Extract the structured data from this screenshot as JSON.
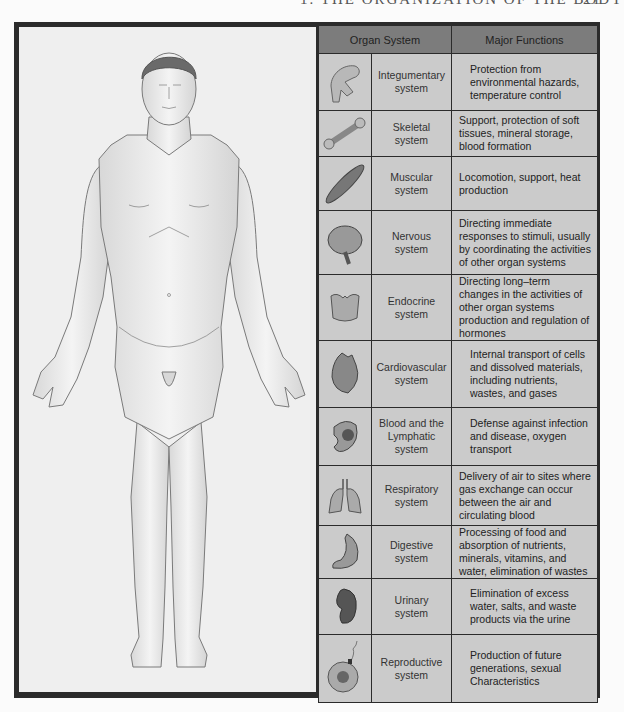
{
  "running_head": {
    "title": "1. THE ORGANIZATION OF THE BODY",
    "page": "21"
  },
  "figure": {
    "label": "Anterior view of human male body"
  },
  "table": {
    "headers": {
      "organ_system": "Organ System",
      "major_functions": "Major Functions"
    },
    "rows": [
      {
        "icon": "hand-skin-icon",
        "name1": "Integumentary",
        "name2": "system",
        "functions": "Protection from environmental hazards, temperature control"
      },
      {
        "icon": "bone-icon",
        "name1": "Skeletal",
        "name2": "system",
        "functions": "Support, protection of soft tissues, mineral storage, blood formation"
      },
      {
        "icon": "muscle-icon",
        "name1": "Muscular",
        "name2": "system",
        "functions": "Locomotion, support, heat production"
      },
      {
        "icon": "brain-icon",
        "name1": "Nervous",
        "name2": "system",
        "functions": "Directing immediate responses to stimuli, usually by coordinating the activities of other organ systems"
      },
      {
        "icon": "thyroid-icon",
        "name1": "Endocrine",
        "name2": "system",
        "functions": "Directing long–term changes in the activities of other organ systems production and regulation of hormones"
      },
      {
        "icon": "heart-icon",
        "name1": "Cardiovascular",
        "name2": "system",
        "functions": "Internal transport of cells and dissolved materials, including nutrients, wastes, and gases"
      },
      {
        "icon": "spleen-icon",
        "name1": "Blood and the",
        "name2": "Lymphatic system",
        "functions": "Defense against infection and disease, oxygen transport"
      },
      {
        "icon": "lungs-icon",
        "name1": "Respiratory",
        "name2": "system",
        "functions": "Delivery of air to sites where gas exchange can occur between the air and circulating blood"
      },
      {
        "icon": "stomach-icon",
        "name1": "Digestive",
        "name2": "system",
        "functions": "Processing of food and absorption of nutrients, minerals, vitamins, and water, elimination of wastes"
      },
      {
        "icon": "kidney-icon",
        "name1": "Urinary",
        "name2": "system",
        "functions": "Elimination of excess water, salts, and waste products via the urine"
      },
      {
        "icon": "egg-sperm-icon",
        "name1": "Reproductive",
        "name2": "system",
        "functions": "Production of future generations, sexual Characteristics"
      }
    ]
  },
  "colors": {
    "frame": "#2b2b2b",
    "header_bg": "#7c7c7c",
    "cell_bg": "#cbcbcb",
    "panel_bg": "#efefef"
  }
}
